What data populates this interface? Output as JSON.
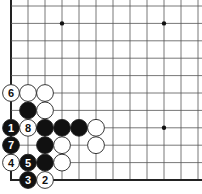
{
  "diagram": {
    "type": "go-board-fragment",
    "region": "lower-left corner",
    "grid": {
      "origin_x": 11,
      "origin_y": 6,
      "spacing_x": 17,
      "spacing_y": 17.4,
      "cols": 12,
      "rows": 11,
      "left_edge": true,
      "bottom_edge": true
    },
    "colors": {
      "line": "#555555",
      "edge": "#222222",
      "black_stone": "#111111",
      "white_stone": "#ffffff",
      "stone_outline": "#222222"
    },
    "hoshi": [
      {
        "col": 3,
        "row": 1
      },
      {
        "col": 9,
        "row": 1
      },
      {
        "col": 9,
        "row": 7
      }
    ],
    "stones": [
      {
        "color": "white",
        "col": 0,
        "row": 5,
        "label": "6"
      },
      {
        "color": "white",
        "col": 1,
        "row": 5,
        "label": ""
      },
      {
        "color": "white",
        "col": 2,
        "row": 5,
        "label": ""
      },
      {
        "color": "black",
        "col": 1,
        "row": 6,
        "label": ""
      },
      {
        "color": "white",
        "col": 2,
        "row": 6,
        "label": ""
      },
      {
        "color": "black",
        "col": 0,
        "row": 7,
        "label": "1"
      },
      {
        "color": "white",
        "col": 1,
        "row": 7,
        "label": "8"
      },
      {
        "color": "black",
        "col": 2,
        "row": 7,
        "label": ""
      },
      {
        "color": "black",
        "col": 3,
        "row": 7,
        "label": ""
      },
      {
        "color": "black",
        "col": 4,
        "row": 7,
        "label": ""
      },
      {
        "color": "white",
        "col": 5,
        "row": 7,
        "label": ""
      },
      {
        "color": "black",
        "col": 0,
        "row": 8,
        "label": "7"
      },
      {
        "color": "black",
        "col": 2,
        "row": 8,
        "label": ""
      },
      {
        "color": "white",
        "col": 3,
        "row": 8,
        "label": ""
      },
      {
        "color": "white",
        "col": 5,
        "row": 8,
        "label": ""
      },
      {
        "color": "white",
        "col": 0,
        "row": 9,
        "label": "4"
      },
      {
        "color": "black",
        "col": 1,
        "row": 9,
        "label": "5"
      },
      {
        "color": "black",
        "col": 2,
        "row": 9,
        "label": ""
      },
      {
        "color": "white",
        "col": 3,
        "row": 9,
        "label": ""
      },
      {
        "color": "black",
        "col": 1,
        "row": 10,
        "label": "3"
      },
      {
        "color": "white",
        "col": 2,
        "row": 10,
        "label": "2"
      }
    ]
  }
}
